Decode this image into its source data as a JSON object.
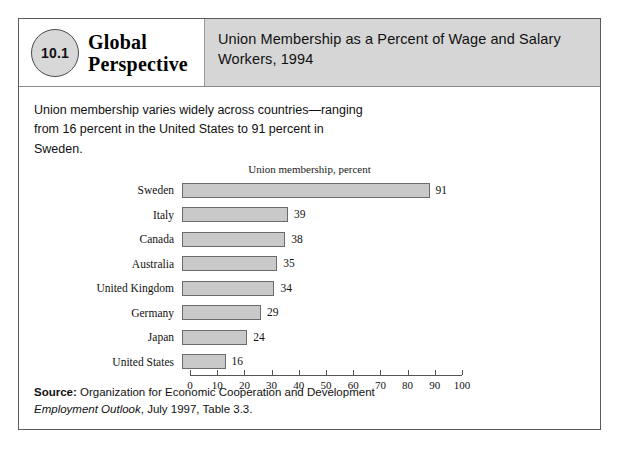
{
  "figure": {
    "badge_number": "10.1",
    "brand_line1": "Global",
    "brand_line2": "Perspective",
    "title": "Union Membership as a Percent of Wage and Salary Workers, 1994",
    "intro": "Union membership varies widely across countries—ranging from 16 percent in the United States to 91 percent in Sweden.",
    "source_prefix": "Source:",
    "source_text_1": " Organization for Economic Cooperation and Development ",
    "source_italic": "Employment Outlook",
    "source_text_2": ", July 1997, Table 3.3."
  },
  "chart_data": {
    "type": "bar",
    "orientation": "horizontal",
    "title": "Union membership, percent",
    "xlabel": "",
    "ylabel": "",
    "xlim": [
      0,
      100
    ],
    "xticks": [
      0,
      10,
      20,
      30,
      40,
      50,
      60,
      70,
      80,
      90,
      100
    ],
    "grid": false,
    "legend": null,
    "bar_color": "#c9c9c9",
    "bar_border_color": "#6b6b6b",
    "categories": [
      "Sweden",
      "Italy",
      "Canada",
      "Australia",
      "United Kingdom",
      "Germany",
      "Japan",
      "United States"
    ],
    "values": [
      91,
      39,
      38,
      35,
      34,
      29,
      24,
      16
    ],
    "data_labels": [
      "91",
      "39",
      "38",
      "35",
      "34",
      "29",
      "24",
      "16"
    ]
  }
}
